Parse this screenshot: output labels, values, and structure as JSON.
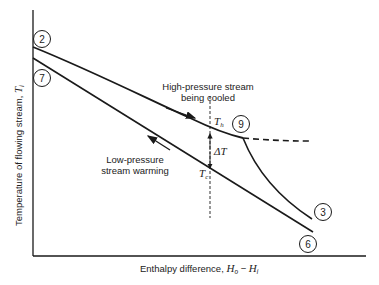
{
  "figure": {
    "y_axis_label": "Temperature of flowing stream, ",
    "y_axis_symbol": "T",
    "y_axis_subscript": "i",
    "x_axis_label": "Enthalpy difference, ",
    "x_axis_symbol_a": "H",
    "x_axis_sub_a": "o",
    "x_axis_minus": " − ",
    "x_axis_symbol_b": "H",
    "x_axis_sub_b": "i",
    "hot_stream_label_line1": "High-pressure stream",
    "hot_stream_label_line2": "being cooled",
    "cold_stream_label_line1": "Low-pressure",
    "cold_stream_label_line2": "stream warming",
    "th_symbol": "T",
    "th_sub": "h",
    "tc_symbol": "T",
    "tc_sub": "c",
    "delta_t": "ΔT",
    "points": {
      "p2": "2",
      "p7": "7",
      "p9": "9",
      "p3": "3",
      "p6": "6"
    }
  },
  "colors": {
    "line": "#1a1a1a",
    "background": "#ffffff"
  }
}
